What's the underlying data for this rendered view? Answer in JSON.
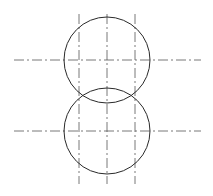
{
  "diagram": {
    "type": "technical-drawing",
    "stroke_color": "#2a2a2a",
    "centerline_color": "#555555",
    "circles": [
      {
        "cx": 107,
        "cy": 60,
        "r": 43
      },
      {
        "cx": 107,
        "cy": 131,
        "r": 43
      }
    ],
    "horizontal_centerlines": [
      {
        "x1": 14,
        "x2": 201,
        "y": 60
      },
      {
        "x1": 14,
        "x2": 201,
        "y": 131
      }
    ],
    "vertical_centerlines": [
      {
        "x": 79,
        "y1": 14,
        "y2": 184
      },
      {
        "x": 107,
        "y1": 14,
        "y2": 184
      },
      {
        "x": 135,
        "y1": 14,
        "y2": 184
      }
    ]
  }
}
